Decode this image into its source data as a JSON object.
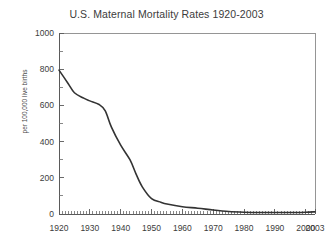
{
  "chart_data": {
    "type": "line",
    "title": "U.S. Maternal Mortality Rates 1920-2003",
    "xlabel": "",
    "ylabel": "per 100,000 live births",
    "xlim": [
      1920,
      2003
    ],
    "ylim": [
      0,
      1000
    ],
    "grid": false,
    "legend": "none",
    "y_ticks_major": [
      0,
      200,
      400,
      600,
      800,
      1000
    ],
    "y_ticks_minor_step": 100,
    "x_ticks_labeled": [
      1920,
      1930,
      1940,
      1950,
      1960,
      1970,
      1980,
      1990,
      2000,
      2003
    ],
    "x_ticks_minor_step": 1,
    "line_color": "#333333",
    "series": [
      {
        "name": "U.S. maternal mortality rate",
        "x": [
          1920,
          1923,
          1925,
          1928,
          1930,
          1933,
          1935,
          1937,
          1940,
          1943,
          1945,
          1947,
          1950,
          1953,
          1955,
          1960,
          1965,
          1970,
          1975,
          1980,
          1985,
          1990,
          1995,
          2000,
          2003
        ],
        "values": [
          795,
          720,
          670,
          640,
          625,
          605,
          570,
          480,
          380,
          300,
          220,
          150,
          85,
          65,
          55,
          40,
          32,
          22,
          14,
          10,
          8,
          8,
          8,
          10,
          12
        ]
      }
    ]
  },
  "axis": {
    "y_tick_labels": [
      "1000",
      "800",
      "600",
      "400",
      "200",
      "0"
    ],
    "x_tick_labels": [
      "1920",
      "1930",
      "1940",
      "1950",
      "1960",
      "1970",
      "1980",
      "1990",
      "2000",
      "2003"
    ]
  }
}
